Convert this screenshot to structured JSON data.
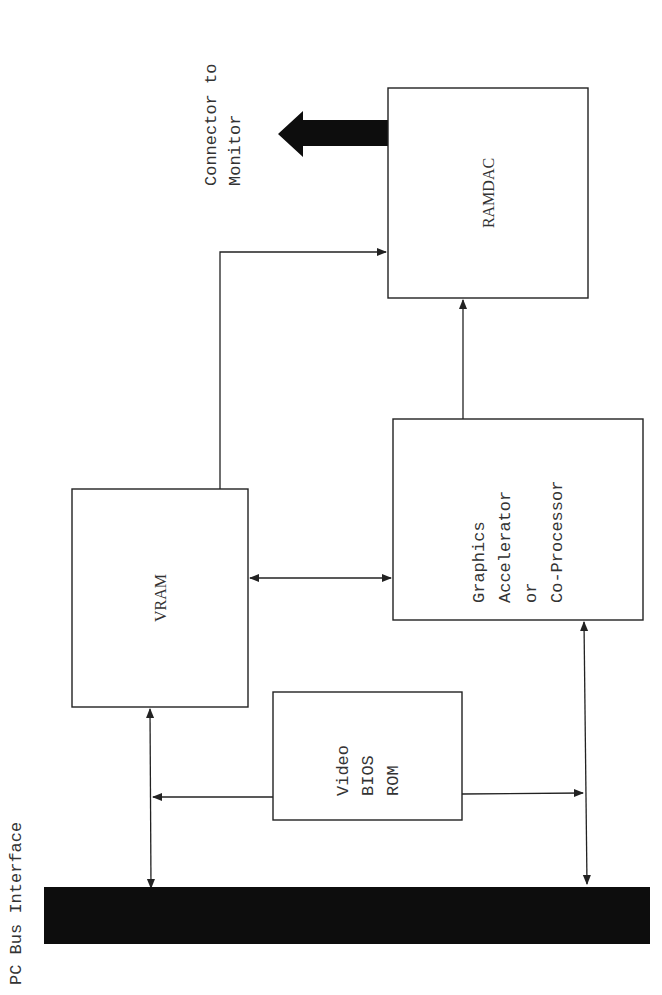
{
  "diagram": {
    "labels": {
      "connector": [
        "Connector to",
        "Monitor"
      ],
      "bus": "PC Bus Interface"
    },
    "blocks": [
      {
        "id": "ramdac",
        "lines": [
          "RAMDAC"
        ]
      },
      {
        "id": "graphics",
        "lines": [
          "Graphics",
          "Accelerator",
          "or",
          "Co-Processor"
        ]
      },
      {
        "id": "vram",
        "lines": [
          "VRAM"
        ]
      },
      {
        "id": "bios",
        "lines": [
          "Video",
          "BIOS",
          "ROM"
        ]
      }
    ],
    "connections": [
      {
        "from": "vram",
        "to": "ramdac",
        "direction": "one-way"
      },
      {
        "from": "graphics",
        "to": "ramdac",
        "direction": "one-way"
      },
      {
        "from": "vram",
        "to": "graphics",
        "direction": "two-way"
      },
      {
        "from": "bus",
        "to": "vram",
        "direction": "two-way"
      },
      {
        "from": "bus",
        "to": "graphics",
        "direction": "two-way"
      },
      {
        "from": "bios",
        "to": "bus",
        "direction": "one-way"
      },
      {
        "from": "ramdac",
        "to": "monitor",
        "direction": "one-way"
      }
    ],
    "colors": {
      "ink": "#222222",
      "bus_fill": "#0d0d0d",
      "background": "#ffffff"
    }
  }
}
